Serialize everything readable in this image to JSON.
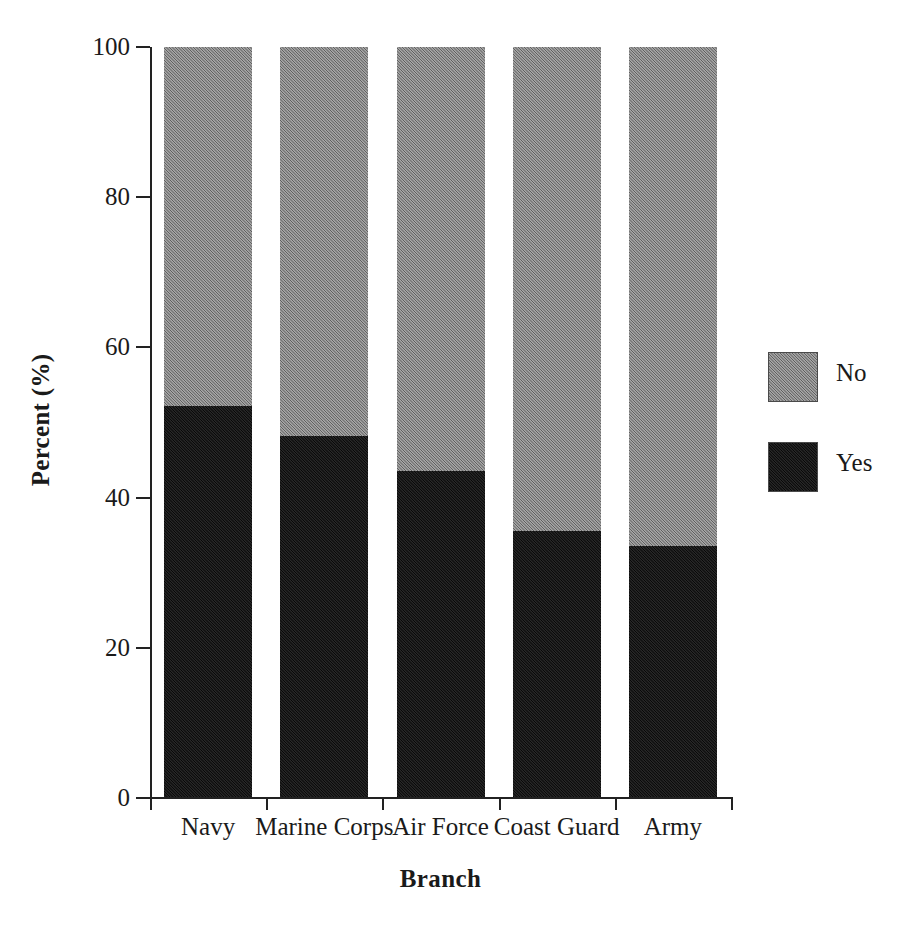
{
  "chart_data": {
    "type": "bar",
    "subtype": "stacked-bar-100",
    "title": "",
    "xlabel": "Branch",
    "ylabel": "Percent (%)",
    "ylim": [
      0,
      100
    ],
    "yticks": [
      0,
      20,
      40,
      60,
      80,
      100
    ],
    "ytick_labels": [
      "0",
      "20",
      "40",
      "60",
      "80",
      "100"
    ],
    "grid": false,
    "legend_position": "right",
    "categories": [
      "Navy",
      "Marine Corps",
      "Air Force",
      "Coast Guard",
      "Army"
    ],
    "series": [
      {
        "name": "Yes",
        "color": "#0c0c0c",
        "values": [
          52.2,
          48.2,
          43.5,
          35.5,
          33.5
        ]
      },
      {
        "name": "No",
        "color": "#828282",
        "values": [
          47.8,
          51.8,
          56.5,
          64.5,
          66.5
        ]
      }
    ],
    "stack_order_bottom_to_top": [
      "Yes",
      "No"
    ],
    "legend_order_top_to_bottom": [
      "No",
      "Yes"
    ]
  },
  "axes": {
    "y": {
      "title": "Percent (%)",
      "ticks": [
        {
          "value": 100,
          "label": "100"
        },
        {
          "value": 80,
          "label": "80"
        },
        {
          "value": 60,
          "label": "60"
        },
        {
          "value": 40,
          "label": "40"
        },
        {
          "value": 20,
          "label": "20"
        },
        {
          "value": 0,
          "label": "0"
        }
      ]
    },
    "x": {
      "title": "Branch",
      "labels": [
        "Navy",
        "Marine Corps",
        "Air Force",
        "Coast Guard",
        "Army"
      ]
    }
  },
  "legend": {
    "items": [
      {
        "label": "No",
        "color": "#828282",
        "swatch": "gray-swatch"
      },
      {
        "label": "Yes",
        "color": "#0c0c0c",
        "swatch": "black-swatch"
      }
    ]
  },
  "colors": {
    "no": "#828282",
    "yes": "#0c0c0c",
    "axis": "#222222",
    "text": "#1a1a1a",
    "background": "#ffffff"
  }
}
